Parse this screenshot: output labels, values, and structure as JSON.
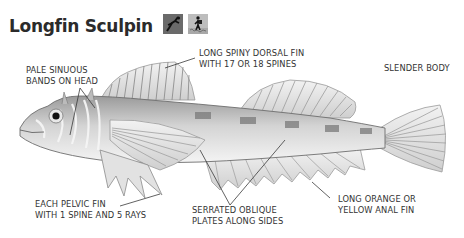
{
  "header": {
    "title": "Longfin Sculpin",
    "icons": [
      {
        "name": "diver-icon",
        "bg": "#6a6a6a"
      },
      {
        "name": "shore-walker-icon",
        "bg": "#b8b8b8"
      }
    ]
  },
  "labels": {
    "dorsal_fin": {
      "line1": "LONG SPINY DORSAL FIN",
      "line2": "WITH 17 OR 18 SPINES"
    },
    "body": {
      "line1": "SLENDER BODY"
    },
    "head_bands": {
      "line1": "PALE SINUOUS",
      "line2": "BANDS ON HEAD"
    },
    "pelvic_fin": {
      "line1": "EACH PELVIC FIN",
      "line2": "WITH 1 SPINE AND 5 RAYS"
    },
    "side_plates": {
      "line1": "SERRATED OBLIQUE",
      "line2": "PLATES ALONG SIDES"
    },
    "anal_fin": {
      "line1": "LONG ORANGE OR",
      "line2": "YELLOW ANAL FIN"
    }
  },
  "colors": {
    "title": "#2b2b2b",
    "label": "#333333",
    "fish_body": "#d9d9d9",
    "fish_shadow": "#8c8c8c",
    "fin": "#e6e6e6",
    "leader_line": "#3a3a3a"
  }
}
